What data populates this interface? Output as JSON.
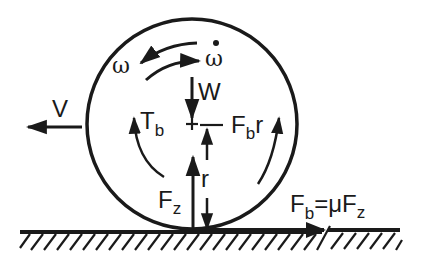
{
  "diagram": {
    "type": "free-body diagram",
    "colors": {
      "ink": "#1a1a1a",
      "background": "#ffffff"
    },
    "labels": {
      "velocity": "V",
      "angular_velocity": "ω",
      "angular_acceleration": "ω",
      "angular_acceleration_dot": "•",
      "weight": "W",
      "brake_torque_main": "T",
      "brake_torque_sub": "b",
      "brake_moment_main": "F",
      "brake_moment_sub": "b",
      "brake_moment_suffix": "r",
      "radius": "r",
      "normal_force_main": "F",
      "normal_force_sub": "z",
      "friction_eq_lhs_main": "F",
      "friction_eq_lhs_sub": "b",
      "friction_eq_mid": "=μF",
      "friction_eq_rhs_sub": "z"
    },
    "relation": "F_b = μ F_z"
  }
}
